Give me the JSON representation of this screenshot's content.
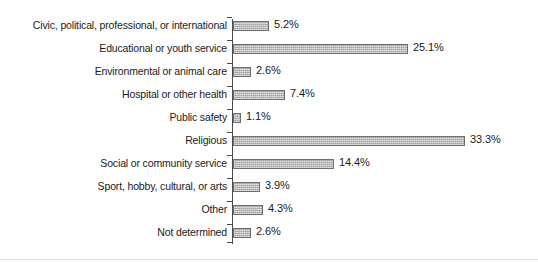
{
  "chart_data": {
    "type": "bar",
    "orientation": "horizontal",
    "title": "",
    "subtitle": "",
    "xlabel": "",
    "ylabel": "",
    "grid": false,
    "legend": null,
    "xlim": [
      0,
      33.3
    ],
    "value_suffix": "%",
    "categories": [
      "Civic, political, professional, or international",
      "Educational or youth service",
      "Environmental or animal care",
      "Hospital or other health",
      "Public safety",
      "Religious",
      "Social or community service",
      "Sport, hobby, cultural, or arts",
      "Other",
      "Not determined"
    ],
    "values": [
      5.2,
      25.1,
      2.6,
      7.4,
      1.1,
      33.3,
      14.4,
      3.9,
      4.3,
      2.6
    ],
    "data_labels": [
      "5.2%",
      "25.1%",
      "2.6%",
      "7.4%",
      "1.1%",
      "33.3%",
      "14.4%",
      "3.9%",
      "4.3%",
      "2.6%"
    ],
    "colors": {
      "bar_fill": "#b4b4b4",
      "bar_border": "#6e6e6e",
      "axis": "#4a4a4a",
      "text": "#1a1a1a",
      "background": "#ffffff",
      "rule": "#d9dadc"
    }
  }
}
